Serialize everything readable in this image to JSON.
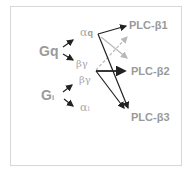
{
  "diagram": {
    "sources": [
      {
        "id": "gq",
        "label": "Gq"
      },
      {
        "id": "gi",
        "label": "G",
        "subscript": "i"
      }
    ],
    "subunits": [
      {
        "id": "alpha-q",
        "symbol": "α",
        "subscript": "q"
      },
      {
        "id": "beta-gamma-q",
        "symbol": "βγ"
      },
      {
        "id": "beta-gamma-i",
        "symbol": "βγ"
      },
      {
        "id": "alpha-i",
        "symbol": "α",
        "subscript": "i"
      }
    ],
    "targets": [
      {
        "id": "plc-b1",
        "label": "PLC-β1"
      },
      {
        "id": "plc-b2",
        "label": "PLC-β2"
      },
      {
        "id": "plc-b3",
        "label": "PLC-β3"
      }
    ],
    "edges": [
      {
        "from": "gq",
        "to": "alpha-q",
        "style": "solid"
      },
      {
        "from": "gq",
        "to": "beta-gamma-q",
        "style": "solid"
      },
      {
        "from": "gi",
        "to": "beta-gamma-i",
        "style": "solid"
      },
      {
        "from": "gi",
        "to": "alpha-i",
        "style": "solid"
      },
      {
        "from": "alpha-q",
        "to": "plc-b1",
        "style": "solid-dark"
      },
      {
        "from": "alpha-q",
        "to": "plc-b3",
        "style": "solid-dark"
      },
      {
        "from": "alpha-q",
        "to": "plc-b2",
        "style": "solid-light"
      },
      {
        "from": "beta-gamma",
        "to": "plc-b1",
        "style": "dashed-light"
      },
      {
        "from": "beta-gamma",
        "to": "plc-b2",
        "style": "solid-dark-thick"
      },
      {
        "from": "beta-gamma",
        "to": "plc-b3",
        "style": "solid-dark"
      }
    ],
    "colors": {
      "arrow_dark": "#222222",
      "arrow_light": "#b8b8b8",
      "text": "#9a9a9a",
      "border": "#d8d8d8"
    }
  }
}
